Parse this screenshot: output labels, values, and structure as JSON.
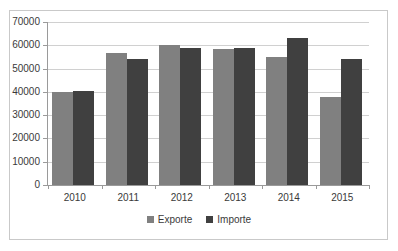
{
  "chart_data": {
    "type": "bar",
    "title": "",
    "xlabel": "",
    "ylabel": "",
    "categories": [
      "2010",
      "2011",
      "2012",
      "2013",
      "2014",
      "2015"
    ],
    "series": [
      {
        "name": "Exporte",
        "color": "#808080",
        "values": [
          40000,
          56500,
          60000,
          58500,
          55000,
          38000
        ]
      },
      {
        "name": "Importe",
        "color": "#404040",
        "values": [
          40500,
          54000,
          59000,
          59000,
          63000,
          54000
        ]
      }
    ],
    "ylim": [
      0,
      70000
    ],
    "ytick_labels": [
      "70000",
      "60000",
      "50000",
      "40000",
      "30000",
      "20000",
      "10000",
      "0"
    ],
    "ytick_values": [
      70000,
      60000,
      50000,
      40000,
      30000,
      20000,
      10000,
      0
    ],
    "grid": true,
    "legend_position": "bottom"
  },
  "legend": {
    "items": [
      {
        "label": "Exporte"
      },
      {
        "label": "Importe"
      }
    ]
  }
}
